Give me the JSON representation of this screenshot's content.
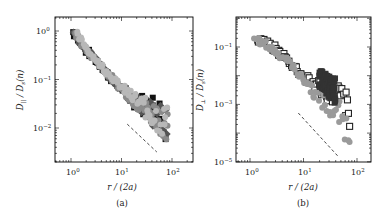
{
  "chart_data": [
    {
      "type": "scatter",
      "panel": "(a)",
      "title": "",
      "xlabel": "r / (2a)",
      "ylabel": "D_∥ / D_s(n)",
      "xscale": "log",
      "yscale": "log",
      "xlim": [
        0.5,
        130
      ],
      "ylim": [
        0.0025,
        2
      ],
      "xticks": [
        "10^0",
        "10^1",
        "10^2"
      ],
      "yticks": [
        "10^0",
        "10^-1",
        "10^-2"
      ],
      "grid": false,
      "legend": null,
      "series": [
        {
          "name": "black squares",
          "color": "#111111",
          "marker": "square",
          "x": [
            1.1,
            1.5,
            2,
            3,
            4,
            6,
            8,
            12,
            16,
            20,
            25,
            30,
            40,
            50,
            60,
            70,
            80
          ],
          "y": [
            0.95,
            0.6,
            0.4,
            0.25,
            0.18,
            0.11,
            0.08,
            0.055,
            0.04,
            0.035,
            0.032,
            0.03,
            0.028,
            0.025,
            0.02,
            0.01,
            0.004
          ]
        },
        {
          "name": "dark gray diamonds",
          "color": "#555555",
          "marker": "diamond",
          "x": [
            1.1,
            1.5,
            2,
            3,
            4,
            6,
            8,
            12,
            16,
            20,
            30,
            40,
            50,
            60,
            70,
            80
          ],
          "y": [
            0.95,
            0.62,
            0.42,
            0.26,
            0.18,
            0.11,
            0.08,
            0.055,
            0.042,
            0.035,
            0.025,
            0.02,
            0.017,
            0.015,
            0.012,
            0.01
          ]
        },
        {
          "name": "mid gray circles",
          "color": "#8a8a8a",
          "marker": "circle",
          "x": [
            1.2,
            2,
            3,
            5,
            8,
            12,
            20,
            30,
            50,
            70,
            85
          ],
          "y": [
            0.9,
            0.4,
            0.26,
            0.15,
            0.08,
            0.055,
            0.035,
            0.025,
            0.018,
            0.014,
            0.012
          ]
        },
        {
          "name": "light gray",
          "color": "#b8b8b8",
          "marker": "circle",
          "x": [
            1.3,
            2.5,
            5,
            10,
            20,
            40,
            60,
            80
          ],
          "y": [
            0.85,
            0.33,
            0.15,
            0.07,
            0.036,
            0.02,
            0.015,
            0.013
          ]
        }
      ],
      "annotations": [
        {
          "type": "dashed-line",
          "description": "reference power-law slope",
          "x": [
            13,
            50
          ],
          "y": [
            0.012,
            0.0032
          ]
        }
      ]
    },
    {
      "type": "scatter",
      "panel": "(b)",
      "title": "",
      "xlabel": "r / (2a)",
      "ylabel": "D_⊥ / D_s(n)",
      "xscale": "log",
      "yscale": "log",
      "xlim": [
        0.5,
        130
      ],
      "ylim": [
        1e-05,
        1
      ],
      "xticks": [
        "10^0",
        "10^1",
        "10^2"
      ],
      "yticks": [
        "10^-1",
        "10^-3",
        "10^-5"
      ],
      "grid": false,
      "legend": null,
      "series": [
        {
          "name": "open squares",
          "color": "#ffffff",
          "edge": "#222222",
          "marker": "square",
          "x": [
            1.4,
            1.8,
            2.2,
            2.8,
            3.5,
            4.5,
            5.5,
            7,
            9,
            11,
            14,
            18,
            22,
            28,
            35,
            45,
            55,
            65,
            75
          ],
          "y": [
            0.2,
            0.16,
            0.12,
            0.09,
            0.065,
            0.045,
            0.03,
            0.02,
            0.012,
            0.008,
            0.006,
            0.005,
            0.0035,
            0.003,
            0.0025,
            0.002,
            0.0015,
            0.0008,
            0.0002
          ]
        },
        {
          "name": "gray circles",
          "color": "#9a9a9a",
          "marker": "circle",
          "x": [
            1.2,
            2,
            3,
            5,
            8,
            12,
            20,
            30,
            50,
            70
          ],
          "y": [
            0.2,
            0.12,
            0.07,
            0.035,
            0.012,
            0.005,
            0.0015,
            0.0008,
            0.0004,
            0.0001
          ]
        },
        {
          "name": "dark filled",
          "color": "#333333",
          "marker": "square",
          "x": [
            20,
            25,
            30,
            40
          ],
          "y": [
            0.008,
            0.006,
            0.004,
            0.003
          ]
        }
      ],
      "annotations": [
        {
          "type": "dashed-line",
          "description": "reference power-law slope",
          "x": [
            8,
            45
          ],
          "y": [
            0.0005,
            1.5e-05
          ]
        }
      ]
    }
  ],
  "panels": {
    "a": {
      "caption": "(a)",
      "xlabel": "r / (2a)",
      "ylabel_main": "D",
      "ylabel_sub": "||",
      "ylabel_den": " / D",
      "ylabel_den_sub": "s",
      "ylabel_tail": "(n)",
      "xticks": [
        {
          "base": "10",
          "exp": "0"
        },
        {
          "base": "10",
          "exp": "1"
        },
        {
          "base": "10",
          "exp": "2"
        }
      ],
      "yticks": [
        {
          "base": "10",
          "exp": "0"
        },
        {
          "base": "10",
          "exp": "−1"
        },
        {
          "base": "10",
          "exp": "−2"
        }
      ]
    },
    "b": {
      "caption": "(b)",
      "xlabel": "r / (2a)",
      "ylabel_main": "D",
      "ylabel_sub": "⊥",
      "ylabel_den": " / D",
      "ylabel_den_sub": "s",
      "ylabel_tail": "(n)",
      "xticks": [
        {
          "base": "10",
          "exp": "0"
        },
        {
          "base": "10",
          "exp": "1"
        },
        {
          "base": "10",
          "exp": "2"
        }
      ],
      "yticks": [
        {
          "base": "10",
          "exp": "−1"
        },
        {
          "base": "10",
          "exp": "−3"
        },
        {
          "base": "10",
          "exp": "−5"
        }
      ]
    }
  }
}
